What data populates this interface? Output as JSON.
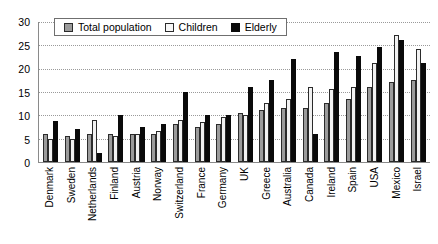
{
  "chart_data": {
    "type": "bar",
    "title": "",
    "xlabel": "",
    "ylabel": "",
    "ylim": [
      0,
      30
    ],
    "ytick_step": 5,
    "yticks": [
      30,
      25,
      20,
      15,
      10,
      5,
      0
    ],
    "grid": true,
    "grid_style": "dotted-horizontal",
    "legend_position": "top-left-inside",
    "categories": [
      "Denmark",
      "Sweden",
      "Netherlands",
      "Finland",
      "Austria",
      "Norway",
      "Switzerland",
      "France",
      "Germany",
      "UK",
      "Greece",
      "Australia",
      "Canada",
      "Ireland",
      "Spain",
      "USA",
      "Mexico",
      "Israel"
    ],
    "series": [
      {
        "name": "Total population",
        "color": "#9b9b9b",
        "values": [
          6.0,
          5.5,
          6.0,
          6.0,
          6.0,
          6.0,
          8.0,
          7.5,
          8.0,
          10.5,
          11.0,
          11.5,
          11.5,
          12.5,
          13.5,
          16.0,
          17.0,
          17.5
        ]
      },
      {
        "name": "Children",
        "color": "#f2f2f2",
        "values": [
          5.0,
          5.0,
          9.0,
          5.5,
          6.0,
          6.5,
          9.0,
          8.5,
          9.5,
          10.0,
          12.5,
          13.5,
          16.0,
          15.5,
          16.0,
          21.0,
          27.0,
          24.0
        ]
      },
      {
        "name": "Elderly",
        "color": "#0a0a0a",
        "values": [
          8.8,
          7.0,
          2.0,
          10.0,
          7.5,
          8.0,
          15.0,
          10.0,
          10.0,
          16.0,
          17.5,
          22.0,
          6.0,
          23.5,
          22.5,
          24.5,
          26.0,
          21.0
        ]
      }
    ]
  },
  "legend": {
    "items": [
      {
        "label": "Total population",
        "swatch": "total-population-swatch"
      },
      {
        "label": "Children",
        "swatch": "children-swatch"
      },
      {
        "label": "Elderly",
        "swatch": "elderly-swatch"
      }
    ]
  }
}
